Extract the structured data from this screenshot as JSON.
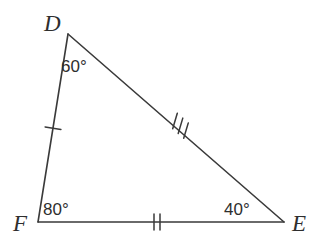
{
  "figure": {
    "type": "triangle-diagram",
    "name": "triangle-DFE",
    "background_color": "#ffffff",
    "stroke_color": "#3a3a3a",
    "text_color": "#2e2e2e",
    "stroke_width": 1.6
  },
  "vertices": [
    {
      "id": "D",
      "label": "D",
      "x": 68,
      "y": 34
    },
    {
      "id": "F",
      "label": "F",
      "x": 38,
      "y": 222
    },
    {
      "id": "E",
      "label": "E",
      "x": 284,
      "y": 222
    }
  ],
  "angles": [
    {
      "at": "D",
      "label": "60°",
      "value": 60,
      "unit": "degrees"
    },
    {
      "at": "F",
      "label": "80°",
      "value": 80,
      "unit": "degrees"
    },
    {
      "at": "E",
      "label": "40°",
      "value": 40,
      "unit": "degrees"
    }
  ],
  "sides": [
    {
      "id": "DF",
      "from": "D",
      "to": "F",
      "tick_marks": 1,
      "tick_symbol": "|",
      "midpoint": {
        "x": 53,
        "y": 128
      }
    },
    {
      "id": "FE",
      "from": "F",
      "to": "E",
      "tick_marks": 2,
      "tick_symbol": "||",
      "midpoint": {
        "x": 157,
        "y": 222
      }
    },
    {
      "id": "DE",
      "from": "D",
      "to": "E",
      "tick_marks": 3,
      "tick_symbol": "|||",
      "midpoint": {
        "x": 178,
        "y": 126
      }
    }
  ]
}
